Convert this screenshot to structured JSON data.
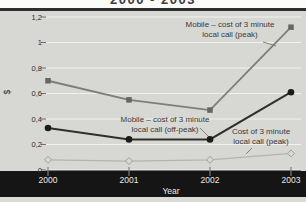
{
  "title": "2000 - 2003",
  "chart_data": {
    "type": "line",
    "title": "2000 - 2003",
    "xlabel": "Year",
    "ylabel": "$",
    "categories": [
      "2000",
      "2001",
      "2002",
      "2003"
    ],
    "ylim": [
      0,
      1.2
    ],
    "ytick_values": [
      0,
      0.2,
      0.4,
      0.6,
      0.8,
      1,
      1.2
    ],
    "ytick_labels": [
      "0",
      "0,2",
      "0,4",
      "0,6",
      "0,8",
      "1",
      "1,2"
    ],
    "grid": true,
    "legend_position": "inline-annotations-with-leader-lines",
    "series": [
      {
        "key": "mobile-peak",
        "name": "Mobile – cost of 3 minute local call (peak)",
        "label_lines": [
          "Mobile – cost of 3 minute",
          "local call (peak)"
        ],
        "marker": "square",
        "line_color": "#7d7d79",
        "marker_color": "#666662",
        "values": [
          0.7,
          0.55,
          0.47,
          1.12
        ]
      },
      {
        "key": "mobile-offpeak",
        "name": "Mobile – cost of 3 minute local call (off-peak)",
        "label_lines": [
          "Mobile – cost of 3 minute",
          "local call (off-peak)"
        ],
        "marker": "circle",
        "line_color": "#2f2f2b",
        "marker_color": "#1b1b19",
        "values": [
          0.33,
          0.24,
          0.24,
          0.61
        ]
      },
      {
        "key": "fixed-peak",
        "name": "Cost of 3 minute local call (peak)",
        "label_lines": [
          "Cost of 3 minute",
          "local call (peak)"
        ],
        "marker": "diamond",
        "line_color": "#b4b4b0",
        "marker_color": "#a0a09c",
        "values": [
          0.08,
          0.07,
          0.08,
          0.13
        ]
      }
    ]
  },
  "colors": {
    "title_text": "#3c3c3c",
    "top_bar": "#2d2d2d",
    "plot_bg": "#d7d7d3",
    "gridline": "#f1f1ed",
    "axis_line": "#7a7a76",
    "axis_tick": "#6f6f6b",
    "xaxis_band_bg": "#151515",
    "xaxis_band_tick": "#90908c",
    "xaxis_text": "#eaeaea",
    "annotation_text": "#3a3a3a",
    "leader_line": "#82827e"
  }
}
